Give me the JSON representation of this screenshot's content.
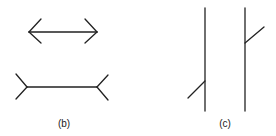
{
  "figure": {
    "panels": [
      {
        "id": "b",
        "label": "(b)",
        "description": "Müller-Lyer illusion: two equal-length lines, one with inward arrowheads and one with outward fins"
      },
      {
        "id": "c",
        "label": "(c)",
        "description": "Two vertical lines with oblique segments attached at different heights"
      }
    ],
    "stroke_color": "#222222",
    "background": "#ffffff"
  }
}
